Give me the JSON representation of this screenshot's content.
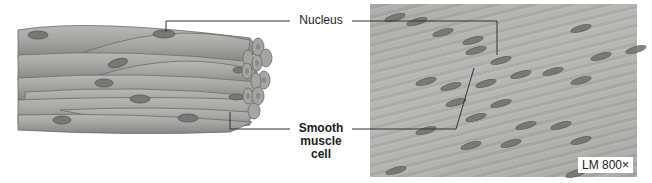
{
  "figure": {
    "type": "smooth muscle tissue illustration with light micrograph",
    "labels": {
      "nucleus": "Nucleus",
      "smooth_muscle_cell": [
        "Smooth",
        "muscle",
        "cell"
      ]
    },
    "micrograph": {
      "magnification_label": "LM 800×"
    },
    "colors": {
      "cell_fill": "#9e9e9c",
      "nucleus_fill": "#6f6f6c",
      "micrograph_bg": "#adadab",
      "leader_line": "#333333"
    }
  }
}
